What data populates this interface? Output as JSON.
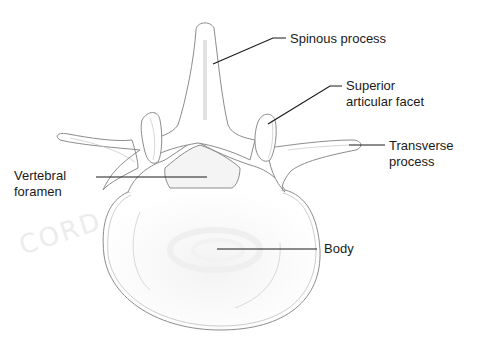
{
  "diagram": {
    "line_color": "#1a1a1a",
    "outline_color": "#9a9a9a",
    "watermark": "CORD",
    "labels": [
      {
        "id": "spinous-process",
        "text": "Spinous process",
        "x": 290,
        "y": 31
      },
      {
        "id": "superior-articular-facet",
        "text": "Superior\narticular facet",
        "x": 346,
        "y": 78
      },
      {
        "id": "transverse-process",
        "text": "Transverse\nprocess",
        "x": 389,
        "y": 138
      },
      {
        "id": "vertebral-foramen",
        "text": "Vertebral\nforamen",
        "x": 14,
        "y": 168
      },
      {
        "id": "body",
        "text": "Body",
        "x": 324,
        "y": 241
      }
    ],
    "leader_lines": [
      {
        "id": "spinous-process",
        "points": "213,64 273,38 286,38"
      },
      {
        "id": "superior-articular-facet",
        "points": "268,124 330,86 342,86"
      },
      {
        "id": "transverse-process",
        "points": "349,145 385,145"
      },
      {
        "id": "vertebral-foramen",
        "points": "96,177 207,177"
      },
      {
        "id": "body",
        "points": "217,249 317,249"
      }
    ]
  }
}
